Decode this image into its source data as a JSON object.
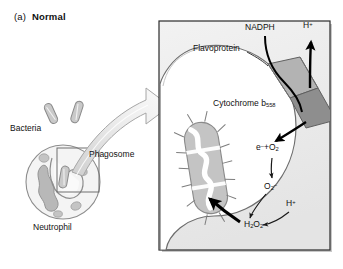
{
  "figure": {
    "panel_index": "(a)",
    "panel_title": "Normal",
    "title_full": "(a)  Normal"
  },
  "left_scene": {
    "bacteria_label": "Bacteria",
    "phagosome_label": "Phagosome",
    "neutrophil_label": "Neutrophil"
  },
  "right_panel": {
    "flavoprotein_label": "Flavoprotein",
    "nadph_label": "NADPH",
    "proton_out_label": "H+",
    "cytochrome_label": "Cytochrome b558",
    "cytochrome_main": "Cytochrome b",
    "cytochrome_sub": "558"
  },
  "reactions": {
    "step1": "e- +O2",
    "step1_parts": {
      "electron": "e",
      "electron_sup": "–",
      "plus": "+O",
      "o2_sub": "2"
    },
    "step2": "O2-",
    "step2_parts": {
      "main": "O",
      "sub": "2",
      "sup": "–"
    },
    "proton_in": "H+",
    "step3": "H2O2",
    "step3_parts": {
      "h": "H",
      "h_sub": "2",
      "o": "O",
      "o_sub": "2"
    }
  },
  "colors": {
    "ink": "#111111",
    "panel_fill": "#ededed",
    "panel_border": "#2b2b2b",
    "panel_shadow": "#9a9a9a",
    "phagosome_fill": "#ffffff",
    "membrane_stroke": "#6d6d6d",
    "complex_fill": "#b3b3b3",
    "complex_dark": "#8e8e8e",
    "bacteria_fill": "#c9c9c9",
    "bacteria_stroke": "#8a8a8a",
    "granule_fill": "#c4c4c4",
    "nucleus_fill": "#b8b8b8",
    "arrow_fill": "#ffffff",
    "arrow_stroke": "#9b9b9b",
    "arrow_shadow": "#d8d8d8",
    "bold_arrow": "#000000",
    "thin_arrow": "#1a1a1a"
  }
}
